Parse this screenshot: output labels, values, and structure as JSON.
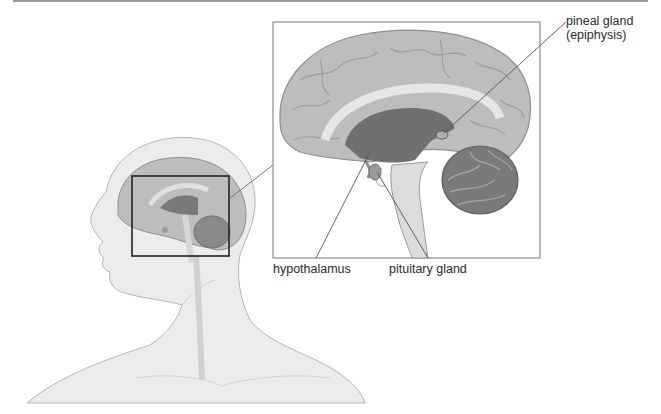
{
  "figure": {
    "colors": {
      "rule": "#9a9a9a",
      "inset_border": "#8c8c8c",
      "locator_box": "#222222",
      "skin": "#ececec",
      "cortex": "#b8b8b8",
      "cortex_dark": "#8f8f8f",
      "ventricle": "#6e6e6e",
      "cerebellum": "#7a7a7a",
      "brainstem": "#d8d8d8",
      "leader_line": "#555555"
    }
  },
  "labels": {
    "pineal_line1": "pineal gland",
    "pineal_line2": "(epiphysis)",
    "hypothalamus": "hypothalamus",
    "pituitary": "pituitary gland"
  }
}
